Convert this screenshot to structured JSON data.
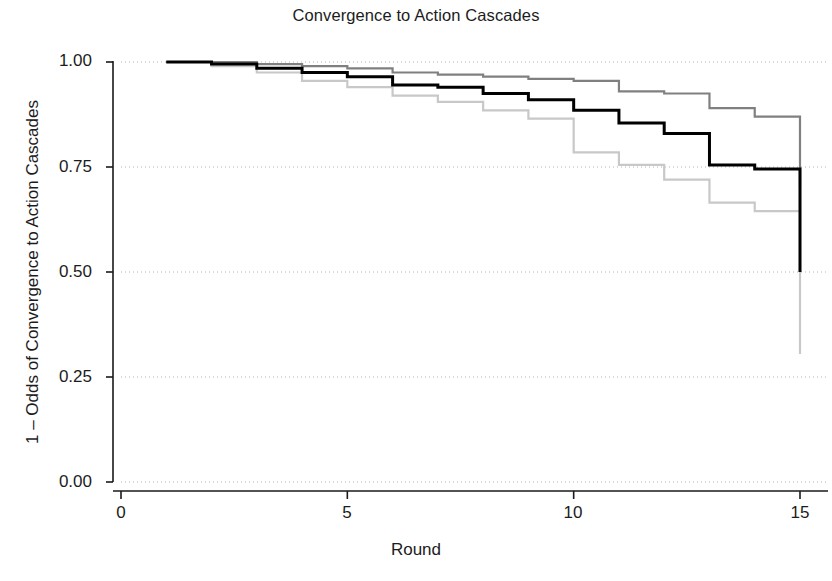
{
  "chart_data": {
    "type": "line",
    "title": "Convergence to Action Cascades",
    "xlabel": "Round",
    "ylabel": "1 – Odds of Convergence to Action Cascades",
    "xlim": [
      0,
      15
    ],
    "ylim": [
      0.0,
      1.0
    ],
    "xticks": [
      0,
      5,
      10,
      15
    ],
    "xtick_labels": [
      "0",
      "5",
      "10",
      "15"
    ],
    "yticks": [
      0.0,
      0.25,
      0.5,
      0.75,
      1.0
    ],
    "ytick_labels": [
      "0.00",
      "0.25",
      "0.50",
      "0.75",
      "1.00"
    ],
    "grid": "horizontal-dotted",
    "legend": "none",
    "step_type": "post",
    "x": [
      1,
      2,
      3,
      4,
      5,
      6,
      7,
      8,
      9,
      10,
      11,
      12,
      13,
      14,
      15
    ],
    "series": [
      {
        "name": "upper-curve",
        "color": "#808080",
        "linewidth": 2.2,
        "values": [
          1.0,
          1.0,
          0.995,
          0.99,
          0.985,
          0.975,
          0.97,
          0.965,
          0.96,
          0.955,
          0.93,
          0.925,
          0.89,
          0.87,
          0.805
        ],
        "final_drop_to": 0.7
      },
      {
        "name": "middle-curve",
        "color": "#000000",
        "linewidth": 3.0,
        "values": [
          1.0,
          0.995,
          0.985,
          0.975,
          0.965,
          0.945,
          0.94,
          0.925,
          0.91,
          0.885,
          0.855,
          0.83,
          0.755,
          0.745,
          0.59
        ],
        "final_drop_to": 0.5
      },
      {
        "name": "lower-curve",
        "color": "#c8c8c8",
        "linewidth": 2.2,
        "values": [
          1.0,
          0.99,
          0.975,
          0.955,
          0.94,
          0.92,
          0.905,
          0.885,
          0.865,
          0.785,
          0.755,
          0.72,
          0.665,
          0.645,
          0.47
        ],
        "final_drop_to": 0.305
      }
    ]
  },
  "axes": {
    "y_tick_0": "0.00",
    "y_tick_1": "0.25",
    "y_tick_2": "0.50",
    "y_tick_3": "0.75",
    "y_tick_4": "1.00",
    "x_tick_0": "0",
    "x_tick_1": "5",
    "x_tick_2": "10",
    "x_tick_3": "15"
  },
  "colors": {
    "upper": "#808080",
    "middle": "#000000",
    "lower": "#c8c8c8",
    "grid": "#b4b4b4",
    "axis": "#1a1a1a",
    "background": "#ffffff"
  }
}
